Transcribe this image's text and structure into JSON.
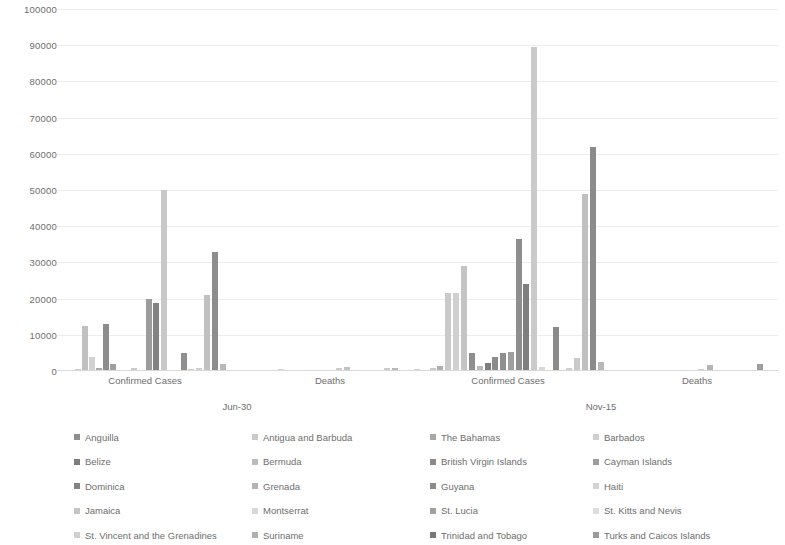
{
  "chart_data": {
    "type": "bar",
    "title": "",
    "subtitle": "",
    "xlabel": "",
    "ylabel": "",
    "ylim": [
      0,
      100000
    ],
    "ytick_step": 10000,
    "ytick_labels": [
      "0",
      "10000",
      "20000",
      "30000",
      "40000",
      "50000",
      "60000",
      "70000",
      "80000",
      "90000",
      "100000"
    ],
    "grid": true,
    "legend_position": "bottom",
    "legend_columns": 4,
    "grouping": "clustered column, metric nested in date",
    "outer_groups": [
      "Jun-30",
      "Nov-15"
    ],
    "inner_categories": [
      "Confirmed Cases",
      "Deaths"
    ],
    "categories": [
      "Jun-30 / Confirmed Cases",
      "Jun-30 / Deaths",
      "Nov-15 / Confirmed Cases",
      "Nov-15 / Deaths"
    ],
    "series": [
      {
        "name": "Anguilla",
        "color": "#8f8f8f",
        "values": [
          3,
          0,
          4,
          0
        ]
      },
      {
        "name": "Antigua and Barbuda",
        "color": "#c9c9c9",
        "values": [
          69,
          3,
          136,
          4
        ]
      },
      {
        "name": "The Bahamas",
        "color": "#a8a8a8",
        "values": [
          104,
          11,
          7039,
          150
        ]
      },
      {
        "name": "Barbados",
        "color": "#cfcfcf",
        "values": [
          97,
          7,
          246,
          7
        ]
      },
      {
        "name": "Belize",
        "color": "#7d7d7d",
        "values": [
          24,
          2,
          4312,
          70
        ]
      },
      {
        "name": "Bermuda",
        "color": "#bcbcbc",
        "values": [
          146,
          9,
          227,
          9
        ]
      },
      {
        "name": "British Virgin Islands",
        "color": "#8a8a8a",
        "values": [
          8,
          1,
          71,
          1
        ]
      },
      {
        "name": "Cayman Islands",
        "color": "#9e9e9e",
        "values": [
          202,
          1,
          265,
          2
        ]
      },
      {
        "name": "Dominica",
        "color": "#838383",
        "values": [
          18,
          0,
          68,
          0
        ]
      },
      {
        "name": "Grenada",
        "color": "#b4b4b4",
        "values": [
          23,
          0,
          37,
          0
        ]
      },
      {
        "name": "Guyana",
        "color": "#8c8c8c",
        "values": [
          12500,
          8,
          21000,
          127
        ]
      },
      {
        "name": "Haiti",
        "color": "#d3d3d3",
        "values": [
          5722,
          100,
          9200,
          232
        ]
      },
      {
        "name": "Jamaica",
        "color": "#c4c4c4",
        "values": [
          700,
          10,
          21000,
          90
        ]
      },
      {
        "name": "Montserrat",
        "color": "#d8d8d8",
        "values": [
          11,
          1,
          13,
          1
        ]
      },
      {
        "name": "St. Lucia",
        "color": "#a0a0a0",
        "values": [
          22,
          0,
          280,
          0
        ]
      },
      {
        "name": "St. Kitts and Nevis",
        "color": "#dddddd",
        "values": [
          16,
          0,
          19,
          0
        ]
      },
      {
        "name": "St. Vincent and the Grenadines",
        "color": "#d0d0d0",
        "values": [
          27,
          0,
          82,
          0
        ]
      },
      {
        "name": "Suriname",
        "color": "#b0b0b0",
        "values": [
          20000,
          45,
          49000,
          1050
        ]
      },
      {
        "name": "Trinidad and Tobago",
        "color": "#777777",
        "values": [
          18700,
          55,
          61800,
          1100
        ]
      },
      {
        "name": "Turks and Caicos Islands",
        "color": "#9a9a9a",
        "values": [
          2000,
          2,
          2200,
          20
        ]
      }
    ],
    "bars": [
      {
        "group": 0,
        "index": 0,
        "series": "Anguilla",
        "value": 400,
        "x": 68,
        "color": "#9a9a9a"
      },
      {
        "group": 0,
        "index": 1,
        "series": "Antigua and Barbuda",
        "value": 600,
        "x": 75,
        "color": "#c9c9c9"
      },
      {
        "group": 0,
        "index": 2,
        "series": "The Bahamas",
        "value": 12500,
        "x": 82,
        "color": "#c0c0c0"
      },
      {
        "group": 0,
        "index": 3,
        "series": "Barbados",
        "value": 4000,
        "x": 89,
        "color": "#d2d2d2"
      },
      {
        "group": 0,
        "index": 4,
        "series": "Belize",
        "value": 800,
        "x": 96,
        "color": "#a9a9a9"
      },
      {
        "group": 0,
        "index": 5,
        "series": "Bermuda",
        "value": 13100,
        "x": 103,
        "color": "#8c8c8c"
      },
      {
        "group": 0,
        "index": 6,
        "series": "British Virgin Islands",
        "value": 2000,
        "x": 110,
        "color": "#9e9e9e"
      },
      {
        "group": 0,
        "index": 7,
        "series": "Cayman Islands",
        "value": 300,
        "x": 117,
        "color": "#c4c4c4"
      },
      {
        "group": 0,
        "index": 8,
        "series": "Dominica",
        "value": 200,
        "x": 124,
        "color": "#bdbdbd"
      },
      {
        "group": 0,
        "index": 9,
        "series": "Grenada",
        "value": 700,
        "x": 131,
        "color": "#c9c9c9"
      },
      {
        "group": 0,
        "index": 10,
        "series": "Guyana",
        "value": 20000,
        "x": 146,
        "color": "#9c9c9c"
      },
      {
        "group": 0,
        "index": 11,
        "series": "Haiti",
        "value": 18700,
        "x": 153,
        "color": "#838383"
      },
      {
        "group": 0,
        "index": 12,
        "series": "Jamaica",
        "value": 50000,
        "x": 161,
        "color": "#c8c8c8"
      },
      {
        "group": 0,
        "index": 13,
        "series": "Montserrat",
        "value": 400,
        "x": 168,
        "color": "#d2d2d2"
      },
      {
        "group": 0,
        "index": 14,
        "series": "St. Lucia",
        "value": 5000,
        "x": 181,
        "color": "#8f8f8f"
      },
      {
        "group": 0,
        "index": 15,
        "series": "St. Kitts and Nevis",
        "value": 600,
        "x": 188,
        "color": "#d2d2d2"
      },
      {
        "group": 0,
        "index": 16,
        "series": "St. Vincent and the Grenadines",
        "value": 700,
        "x": 196,
        "color": "#cfcfcf"
      },
      {
        "group": 0,
        "index": 17,
        "series": "Suriname",
        "value": 21000,
        "x": 204,
        "color": "#c0c0c0"
      },
      {
        "group": 0,
        "index": 18,
        "series": "Trinidad and Tobago",
        "value": 33000,
        "x": 212,
        "color": "#8d8d8d"
      },
      {
        "group": 0,
        "index": 19,
        "series": "Turks and Caicos Islands",
        "value": 2000,
        "x": 220,
        "color": "#b8b8b8"
      },
      {
        "group": 1,
        "index": 0,
        "series": "Anguilla",
        "value": 200,
        "x": 262,
        "color": "#dadada"
      },
      {
        "group": 1,
        "index": 1,
        "series": "Antigua and Barbuda",
        "value": 500,
        "x": 278,
        "color": "#d6d6d6"
      },
      {
        "group": 1,
        "index": 2,
        "series": "The Bahamas",
        "value": 300,
        "x": 294,
        "color": "#dcdcdc"
      },
      {
        "group": 1,
        "index": 3,
        "series": "Barbados",
        "value": 400,
        "x": 310,
        "color": "#d8d8d8"
      },
      {
        "group": 1,
        "index": 4,
        "series": "Belize",
        "value": 300,
        "x": 326,
        "color": "#dadada"
      },
      {
        "group": 1,
        "index": 5,
        "series": "Guyana",
        "value": 700,
        "x": 336,
        "color": "#cfcfcf"
      },
      {
        "group": 1,
        "index": 6,
        "series": "Haiti",
        "value": 1200,
        "x": 344,
        "color": "#c2c2c2"
      },
      {
        "group": 1,
        "index": 7,
        "series": "Jamaica",
        "value": 300,
        "x": 352,
        "color": "#dadada"
      },
      {
        "group": 1,
        "index": 8,
        "series": "Suriname",
        "value": 700,
        "x": 384,
        "color": "#cdcdcd"
      },
      {
        "group": 1,
        "index": 9,
        "series": "Trinidad and Tobago",
        "value": 900,
        "x": 392,
        "color": "#b8b8b8"
      },
      {
        "group": 1,
        "index": 10,
        "series": "Turks and Caicos Islands",
        "value": 300,
        "x": 400,
        "color": "#d8d8d8"
      },
      {
        "group": 2,
        "index": 0,
        "series": "Anguilla",
        "value": 300,
        "x": 398,
        "color": "#cfcfcf"
      },
      {
        "group": 2,
        "index": 1,
        "series": "Antigua and Barbuda",
        "value": 500,
        "x": 414,
        "color": "#d2d2d2"
      },
      {
        "group": 2,
        "index": 2,
        "series": "The Bahamas",
        "value": 800,
        "x": 430,
        "color": "#c9c9c9"
      },
      {
        "group": 2,
        "index": 3,
        "series": "Barbados",
        "value": 1500,
        "x": 437,
        "color": "#b0b0b0"
      },
      {
        "group": 2,
        "index": 4,
        "series": "Belize",
        "value": 21500,
        "x": 445,
        "color": "#cacaca"
      },
      {
        "group": 2,
        "index": 5,
        "series": "Bermuda",
        "value": 21500,
        "x": 453,
        "color": "#d0d0d0"
      },
      {
        "group": 2,
        "index": 6,
        "series": "British Virgin Islands",
        "value": 29000,
        "x": 461,
        "color": "#c4c4c4"
      },
      {
        "group": 2,
        "index": 7,
        "series": "Cayman Islands",
        "value": 5000,
        "x": 469,
        "color": "#8e8e8e"
      },
      {
        "group": 2,
        "index": 8,
        "series": "Dominica",
        "value": 1500,
        "x": 477,
        "color": "#b9b9b9"
      },
      {
        "group": 2,
        "index": 9,
        "series": "Grenada",
        "value": 2300,
        "x": 485,
        "color": "#7e7e7e"
      },
      {
        "group": 2,
        "index": 10,
        "series": "Guyana",
        "value": 4000,
        "x": 492,
        "color": "#8b8b8b"
      },
      {
        "group": 2,
        "index": 11,
        "series": "Haiti",
        "value": 5000,
        "x": 500,
        "color": "#8f8f8f"
      },
      {
        "group": 2,
        "index": 12,
        "series": "Jamaica",
        "value": 5200,
        "x": 508,
        "color": "#a0a0a0"
      },
      {
        "group": 2,
        "index": 13,
        "series": "Montserrat",
        "value": 36500,
        "x": 516,
        "color": "#8e8e8e"
      },
      {
        "group": 2,
        "index": 14,
        "series": "St. Lucia",
        "value": 24000,
        "x": 523,
        "color": "#7f7f7f"
      },
      {
        "group": 2,
        "index": 15,
        "series": "St. Kitts and Nevis",
        "value": 89500,
        "x": 531,
        "color": "#cacaca"
      },
      {
        "group": 2,
        "index": 16,
        "series": "St. Vincent and the Grenadines",
        "value": 1200,
        "x": 539,
        "color": "#d6d6d6"
      },
      {
        "group": 2,
        "index": 17,
        "series": "Suriname",
        "value": 12200,
        "x": 553,
        "color": "#8a8a8a"
      },
      {
        "group": 2,
        "index": 18,
        "series": "Trinidad and Tobago",
        "value": 700,
        "x": 566,
        "color": "#cfcfcf"
      },
      {
        "group": 2,
        "index": 19,
        "series": "Turks and Caicos Islands",
        "value": 3700,
        "x": 574,
        "color": "#c9c9c9"
      },
      {
        "group": 2,
        "index": 20,
        "series": "extra-a",
        "value": 49000,
        "x": 582,
        "color": "#c0c0c0"
      },
      {
        "group": 2,
        "index": 21,
        "series": "extra-b",
        "value": 61800,
        "x": 590,
        "color": "#8b8b8b"
      },
      {
        "group": 2,
        "index": 22,
        "series": "extra-c",
        "value": 2600,
        "x": 598,
        "color": "#b8b8b8"
      },
      {
        "group": 3,
        "index": 0,
        "series": "Anguilla",
        "value": 200,
        "x": 632,
        "color": "#dcdcdc"
      },
      {
        "group": 3,
        "index": 1,
        "series": "Antigua and Barbuda",
        "value": 250,
        "x": 648,
        "color": "#d8d8d8"
      },
      {
        "group": 3,
        "index": 2,
        "series": "Guyana",
        "value": 400,
        "x": 690,
        "color": "#d2d2d2"
      },
      {
        "group": 3,
        "index": 3,
        "series": "Haiti",
        "value": 500,
        "x": 698,
        "color": "#cccccc"
      },
      {
        "group": 3,
        "index": 4,
        "series": "Jamaica",
        "value": 1700,
        "x": 707,
        "color": "#b4b4b4"
      },
      {
        "group": 3,
        "index": 5,
        "series": "Suriname",
        "value": 400,
        "x": 748,
        "color": "#cdcdcd"
      },
      {
        "group": 3,
        "index": 6,
        "series": "Trinidad and Tobago",
        "value": 2000,
        "x": 757,
        "color": "#9e9e9e"
      }
    ]
  },
  "axis": {
    "y_labels": [
      "100000",
      "90000",
      "80000",
      "70000",
      "60000",
      "50000",
      "40000",
      "30000",
      "20000",
      "10000",
      "0"
    ],
    "category_labels": [
      {
        "text": "Confirmed Cases",
        "x": 145
      },
      {
        "text": "Deaths",
        "x": 330
      },
      {
        "text": "Confirmed Cases",
        "x": 508
      },
      {
        "text": "Deaths",
        "x": 697
      }
    ],
    "group_labels": [
      {
        "text": "Jun-30",
        "x": 237
      },
      {
        "text": "Nov-15",
        "x": 601
      }
    ]
  },
  "legend": {
    "items": [
      {
        "label": "Anguilla",
        "color": "#8f8f8f"
      },
      {
        "label": "Antigua and Barbuda",
        "color": "#c9c9c9"
      },
      {
        "label": "The Bahamas",
        "color": "#a8a8a8"
      },
      {
        "label": "Barbados",
        "color": "#cfcfcf"
      },
      {
        "label": "Belize",
        "color": "#7d7d7d"
      },
      {
        "label": "Bermuda",
        "color": "#bcbcbc"
      },
      {
        "label": "British Virgin Islands",
        "color": "#8a8a8a"
      },
      {
        "label": "Cayman Islands",
        "color": "#9e9e9e"
      },
      {
        "label": "Dominica",
        "color": "#838383"
      },
      {
        "label": "Grenada",
        "color": "#b4b4b4"
      },
      {
        "label": "Guyana",
        "color": "#8c8c8c"
      },
      {
        "label": "Haiti",
        "color": "#d3d3d3"
      },
      {
        "label": "Jamaica",
        "color": "#c4c4c4"
      },
      {
        "label": "Montserrat",
        "color": "#d8d8d8"
      },
      {
        "label": "St. Lucia",
        "color": "#a0a0a0"
      },
      {
        "label": "St. Kitts and Nevis",
        "color": "#dddddd"
      },
      {
        "label": "St. Vincent and the Grenadines",
        "color": "#d0d0d0"
      },
      {
        "label": "Suriname",
        "color": "#b0b0b0"
      },
      {
        "label": "Trinidad and Tobago",
        "color": "#777777"
      },
      {
        "label": "Turks and Caicos Islands",
        "color": "#9a9a9a"
      }
    ]
  }
}
